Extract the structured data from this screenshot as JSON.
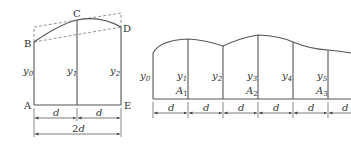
{
  "left_figure": {
    "points": {
      "A": "A",
      "B": "B",
      "C": "C",
      "D": "D",
      "E": "E"
    },
    "ordinates": [
      "y0",
      "y1",
      "y2"
    ],
    "ordinate_labels": [
      {
        "base": "y",
        "sub": "0"
      },
      {
        "base": "y",
        "sub": "1"
      },
      {
        "base": "y",
        "sub": "2"
      }
    ],
    "dimensions": {
      "seg1": "d",
      "seg2": "d",
      "total_num": "2",
      "total_var": "d"
    }
  },
  "right_figure": {
    "ordinate_labels": [
      {
        "base": "y",
        "sub": "0"
      },
      {
        "base": "y",
        "sub": "1"
      },
      {
        "base": "y",
        "sub": "2"
      },
      {
        "base": "y",
        "sub": "3"
      },
      {
        "base": "y",
        "sub": "4"
      },
      {
        "base": "y",
        "sub": "5"
      }
    ],
    "area_labels": [
      {
        "base": "A",
        "sub": "1"
      },
      {
        "base": "A",
        "sub": "2"
      },
      {
        "base": "A",
        "sub": "3"
      }
    ],
    "dimensions": [
      "d",
      "d",
      "d",
      "d",
      "d",
      "d"
    ]
  },
  "colors": {
    "line": "#555555",
    "dash": "#777777",
    "text": "#333333"
  }
}
